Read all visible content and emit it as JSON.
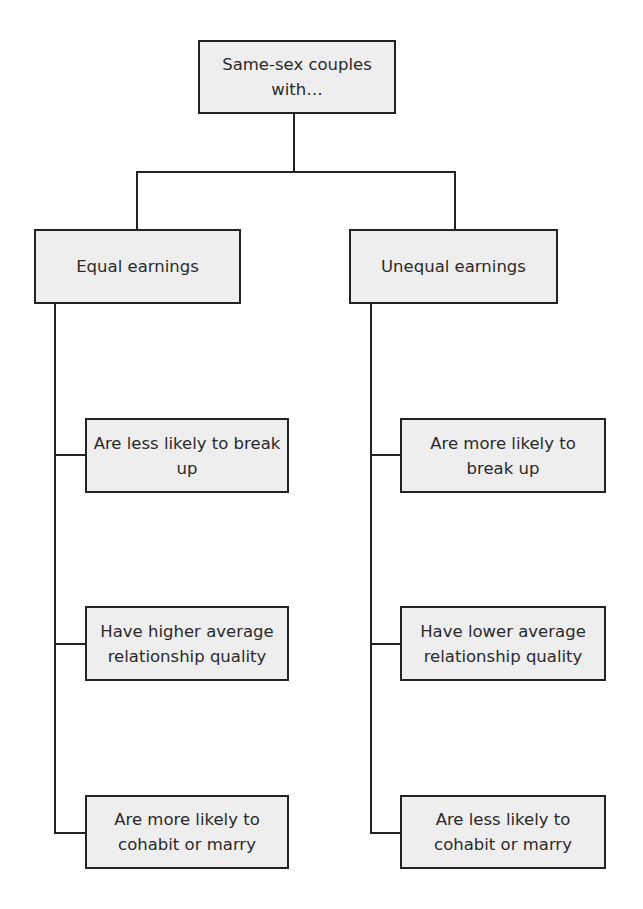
{
  "diagram": {
    "type": "tree",
    "root": {
      "label": "Same-sex couples with…"
    },
    "branches": [
      {
        "label": "Equal earnings",
        "outcomes": [
          "Are less likely to break up",
          "Have higher average relationship quality",
          "Are more likely to cohabit or marry"
        ]
      },
      {
        "label": "Unequal earnings",
        "outcomes": [
          "Are more likely to break up",
          "Have lower average relationship quality",
          "Are less likely to cohabit or marry"
        ]
      }
    ],
    "colors": {
      "box_fill": "#eeeeee",
      "border": "#222222",
      "text": "#2a2a2a"
    }
  }
}
